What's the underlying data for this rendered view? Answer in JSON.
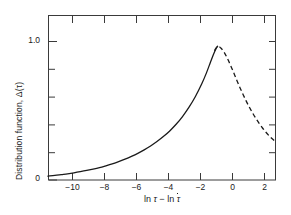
{
  "chart_data": {
    "type": "line",
    "title": "",
    "xlabel": "ln τ − ln τ̄",
    "ylabel": "Distribution function, Δ(τ)",
    "xlim": [
      -10.625,
      3.625
    ],
    "ylim": [
      0.0,
      1.19
    ],
    "xticks": [
      -10,
      -8,
      -6,
      -4,
      -2,
      0,
      2
    ],
    "xticklabels": [
      "−10",
      "−8",
      "−6",
      "−4",
      "−2",
      "0",
      "2"
    ],
    "yticks": [
      0.0,
      0.2,
      0.4,
      0.6,
      0.8,
      1.0
    ],
    "yticklabels": [
      "0",
      "",
      "",
      "",
      "",
      "1.0"
    ],
    "grid": false,
    "legend": null,
    "series": [
      {
        "name": "Distribution function Δ(τ) — measured",
        "style": "solid",
        "color": "#1a1a1a",
        "x": [
          -10.63,
          -10.2,
          -9.8,
          -9.4,
          -9.0,
          -8.6,
          -8.2,
          -7.8,
          -7.4,
          -7.0,
          -6.6,
          -6.2,
          -5.8,
          -5.4,
          -5.0,
          -4.6,
          -4.2,
          -3.8,
          -3.4,
          -3.0,
          -2.6,
          -2.2,
          -1.8,
          -1.4,
          -1.0,
          -0.7,
          -0.45,
          -0.25,
          -0.1,
          0.0
        ],
        "y": [
          0.028,
          0.033,
          0.039,
          0.045,
          0.052,
          0.06,
          0.069,
          0.079,
          0.09,
          0.103,
          0.117,
          0.133,
          0.151,
          0.171,
          0.193,
          0.218,
          0.246,
          0.278,
          0.314,
          0.355,
          0.403,
          0.459,
          0.525,
          0.602,
          0.694,
          0.775,
          0.852,
          0.912,
          0.95,
          0.968
        ]
      },
      {
        "name": "Distribution function Δ(τ) — extrapolated",
        "style": "dashed",
        "color": "#1a1a1a",
        "x": [
          -0.2,
          0.0,
          0.2,
          0.4,
          0.6,
          0.8,
          1.0,
          1.2,
          1.4,
          1.6,
          1.8,
          2.0,
          2.2,
          2.4,
          2.6,
          2.8,
          3.0,
          3.2,
          3.4,
          3.625
        ],
        "y": [
          0.935,
          0.968,
          0.955,
          0.925,
          0.882,
          0.832,
          0.778,
          0.722,
          0.668,
          0.617,
          0.569,
          0.524,
          0.483,
          0.445,
          0.41,
          0.378,
          0.349,
          0.323,
          0.3,
          0.276
        ]
      }
    ],
    "annotations": {
      "peak_x": 0.0,
      "peak_y": 0.97,
      "left_end_y": 0.028,
      "right_end_y": 0.276
    },
    "axis_frame": "box",
    "tick_direction": "in",
    "minor_y_ticks": [
      0.2,
      0.4,
      0.6,
      0.8
    ]
  },
  "axes": {
    "xlabel_parts": {
      "ln1": "ln",
      "tau1": "τ",
      "minus": "−",
      "ln2": "ln",
      "tau2": "τ"
    },
    "ylabel_text": "Distribution function, Δ(τ)",
    "y_top_label": "1.0",
    "y_bottom_label": "0"
  },
  "colors": {
    "background": "#ffffff",
    "axis": "#3a3a3a",
    "curve": "#1a1a1a",
    "text": "#1a1a1a"
  }
}
